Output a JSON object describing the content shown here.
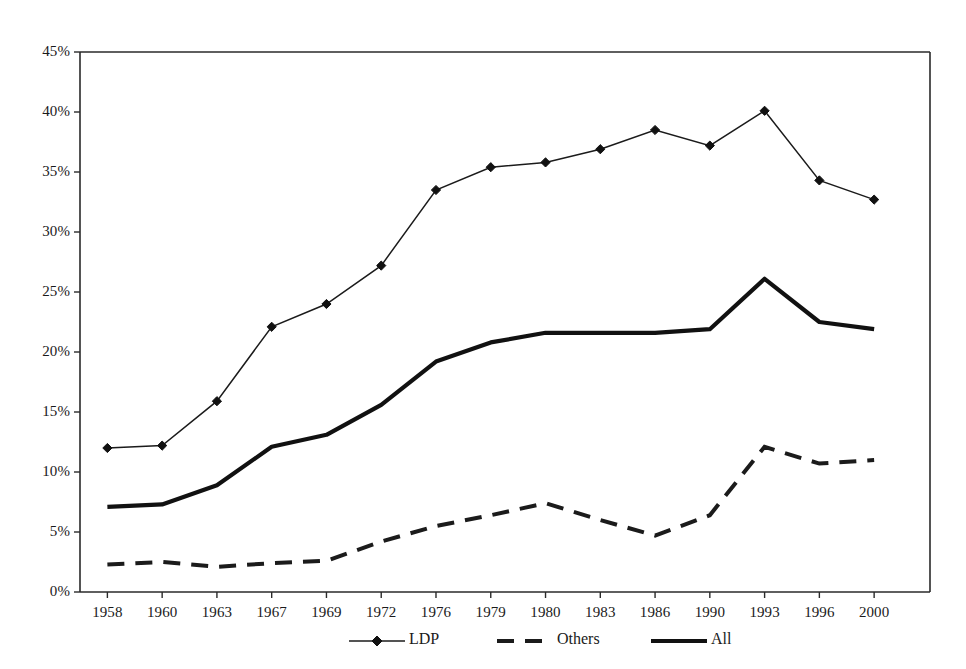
{
  "chart_data": {
    "type": "line",
    "title": "",
    "subtitle": "",
    "xlabel": "",
    "ylabel": "",
    "categories": [
      "1958",
      "1960",
      "1963",
      "1967",
      "1969",
      "1972",
      "1976",
      "1979",
      "1980",
      "1983",
      "1986",
      "1990",
      "1993",
      "1996",
      "2000"
    ],
    "ytick_labels": [
      "0%",
      "5%",
      "10%",
      "15%",
      "20%",
      "25%",
      "30%",
      "35%",
      "40%",
      "45%"
    ],
    "ytick_values": [
      0,
      5,
      10,
      15,
      20,
      25,
      30,
      35,
      40,
      45
    ],
    "ylim": [
      0,
      45
    ],
    "grid": false,
    "legend_position": "bottom",
    "series": [
      {
        "name": "LDP",
        "marker": "diamond",
        "style": "solid-thin",
        "values": [
          12.0,
          12.2,
          15.9,
          22.1,
          24.0,
          27.2,
          33.5,
          35.4,
          35.8,
          36.9,
          38.5,
          37.2,
          40.1,
          34.3,
          32.7
        ]
      },
      {
        "name": "Others",
        "marker": "none",
        "style": "dashed",
        "values": [
          2.3,
          2.5,
          2.1,
          2.4,
          2.6,
          4.2,
          5.5,
          6.4,
          7.4,
          6.0,
          4.7,
          6.4,
          12.1,
          10.7,
          11.0
        ]
      },
      {
        "name": "All",
        "marker": "none",
        "style": "solid-thick",
        "values": [
          7.1,
          7.3,
          8.9,
          12.1,
          13.1,
          15.6,
          19.2,
          20.8,
          21.6,
          21.6,
          21.6,
          21.9,
          26.1,
          22.5,
          21.9
        ]
      }
    ],
    "legend": [
      {
        "label": "LDP",
        "style": "solid-thin-diamond"
      },
      {
        "label": "Others",
        "style": "dashed"
      },
      {
        "label": "All",
        "style": "solid-thick"
      }
    ],
    "colors": {
      "axis": "#2a2a2a",
      "ldp": "#1b1b1b",
      "others": "#1b1b1b",
      "all": "#111111",
      "background": "#ffffff"
    }
  }
}
